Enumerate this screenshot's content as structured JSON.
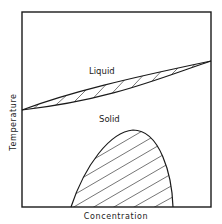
{
  "diagram": {
    "type": "phase-diagram",
    "x_axis_label": "Concentration",
    "y_axis_label": "Temperature",
    "regions": {
      "liquid_label": "Liquid",
      "solid_label": "Solid"
    },
    "features": [
      {
        "name": "liquid-solid two-phase lens",
        "hatched": true,
        "from_left_y_frac": 0.52,
        "to_right_y_frac": 0.25
      },
      {
        "name": "miscibility gap dome",
        "hatched": true,
        "base_left_x_frac": 0.26,
        "base_right_x_frac": 0.8,
        "peak_x_frac": 0.58,
        "peak_y_frac": 0.6
      }
    ],
    "colors": {
      "line": "#1a1a1a",
      "background": "#ffffff"
    }
  }
}
